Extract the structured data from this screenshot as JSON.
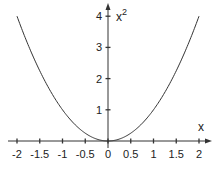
{
  "chart_data": {
    "type": "line",
    "title": "",
    "function": "x^2",
    "xlabel": "x",
    "ylabel": "x²",
    "xlim": [
      -2,
      2
    ],
    "ylim": [
      0,
      4
    ],
    "grid": false,
    "legend": null,
    "x_ticks": [
      -2,
      -1.5,
      -1,
      -0.5,
      0,
      0.5,
      1,
      1.5,
      2
    ],
    "x_tick_labels": [
      "-2",
      "-1.5",
      "-1",
      "-0.5",
      "0",
      "0.5",
      "1",
      "1.5",
      "2"
    ],
    "y_ticks": [
      1,
      2,
      3,
      4
    ],
    "y_tick_labels": [
      "1",
      "2",
      "3",
      "4"
    ],
    "series": [
      {
        "name": "x^2",
        "x": [
          -2,
          -1.5,
          -1,
          -0.5,
          0,
          0.5,
          1,
          1.5,
          2
        ],
        "y": [
          4,
          2.25,
          1,
          0.25,
          0,
          0.25,
          1,
          2.25,
          4
        ]
      }
    ]
  },
  "labels": {
    "x_axis": "x",
    "y_axis_base": "x",
    "y_axis_exp": "2"
  },
  "colors": {
    "axis": "#333333",
    "curve": "#333333"
  }
}
